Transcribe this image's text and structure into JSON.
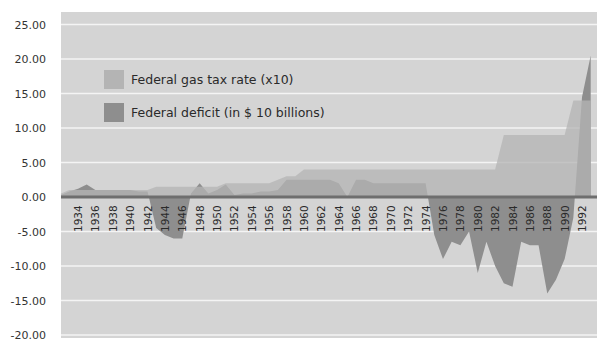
{
  "chart_data": {
    "type": "area",
    "title": "",
    "xlabel": "",
    "ylabel": "",
    "ylim": [
      -20,
      25
    ],
    "yticks": [
      "25.00",
      "20.00",
      "15.00",
      "10.00",
      "5.00",
      "0.00",
      "-5.00",
      "-10.00",
      "-15.00",
      "-20.00"
    ],
    "ytick_values": [
      25,
      20,
      15,
      10,
      5,
      0,
      -5,
      -10,
      -15,
      -20
    ],
    "grid": true,
    "legend_position": "upper-left inside plot",
    "x_tick_labels": [
      "1934",
      "1936",
      "1938",
      "1940",
      "1942",
      "1944",
      "1946",
      "1948",
      "1950",
      "1952",
      "1954",
      "1956",
      "1958",
      "1960",
      "1962",
      "1964",
      "1966",
      "1968",
      "1970",
      "1972",
      "1974",
      "1976",
      "1978",
      "1980",
      "1982",
      "1984",
      "1986",
      "1988",
      "1990",
      "1992"
    ],
    "x": [
      1932,
      1933,
      1934,
      1935,
      1936,
      1937,
      1938,
      1939,
      1940,
      1941,
      1942,
      1943,
      1944,
      1945,
      1946,
      1947,
      1948,
      1949,
      1950,
      1951,
      1952,
      1953,
      1954,
      1955,
      1956,
      1957,
      1958,
      1959,
      1960,
      1961,
      1962,
      1963,
      1964,
      1965,
      1966,
      1967,
      1968,
      1969,
      1970,
      1971,
      1972,
      1973,
      1974,
      1975,
      1976,
      1977,
      1978,
      1979,
      1980,
      1981,
      1982,
      1983,
      1984,
      1985,
      1986,
      1987,
      1988,
      1989,
      1990,
      1991,
      1992,
      1993
    ],
    "series": [
      {
        "name": "Federal gas tax rate (x10)",
        "color": "#b4b4b4",
        "values": [
          0.5,
          1.0,
          1.0,
          1.0,
          1.0,
          1.0,
          1.0,
          1.0,
          1.0,
          1.0,
          1.0,
          1.5,
          1.5,
          1.5,
          1.5,
          1.5,
          1.5,
          1.5,
          1.5,
          2.0,
          2.0,
          2.0,
          2.0,
          2.0,
          2.0,
          2.5,
          3.0,
          3.0,
          4.0,
          4.0,
          4.0,
          4.0,
          4.0,
          4.0,
          4.0,
          4.0,
          4.0,
          4.0,
          4.0,
          4.0,
          4.0,
          4.0,
          4.0,
          4.0,
          4.0,
          4.0,
          4.0,
          4.0,
          4.0,
          4.0,
          4.0,
          9.0,
          9.0,
          9.0,
          9.0,
          9.0,
          9.0,
          9.0,
          9.0,
          14.0,
          14.0,
          14.0
        ]
      },
      {
        "name": "Federal deficit (in $ 10 billions)",
        "color": "#8e8e8e",
        "values": [
          0.3,
          0.8,
          1.2,
          1.8,
          1.0,
          1.0,
          1.0,
          1.0,
          1.0,
          0.8,
          0.8,
          -4.5,
          -5.5,
          -6.0,
          -6.0,
          0.5,
          2.0,
          0.5,
          1.0,
          1.8,
          0.3,
          0.5,
          0.5,
          0.8,
          0.8,
          1.0,
          2.5,
          2.5,
          2.5,
          2.5,
          2.5,
          2.5,
          2.0,
          0.0,
          2.5,
          2.5,
          2.0,
          2.0,
          2.0,
          2.0,
          2.0,
          2.0,
          2.0,
          -5.5,
          -9.0,
          -6.5,
          -7.0,
          -5.0,
          -11.0,
          -6.5,
          -10.0,
          -12.5,
          -13.0,
          -6.5,
          -7.0,
          -7.0,
          -14.0,
          -12.0,
          -9.0,
          -3.0,
          14.5,
          20.5
        ]
      }
    ]
  },
  "legend": {
    "items": [
      {
        "label": "Federal gas tax rate (x10)",
        "color": "#b4b4b4"
      },
      {
        "label": "Federal deficit (in $ 10 billions)",
        "color": "#8e8e8e"
      }
    ]
  }
}
